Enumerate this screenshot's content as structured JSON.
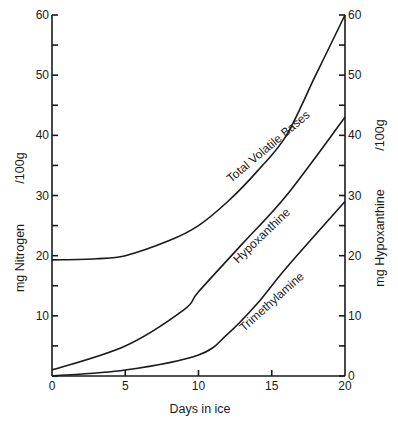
{
  "chart_data": {
    "type": "line",
    "title": "",
    "xlabel": "Days in ice",
    "ylabel": "mg Nitrogen /100g",
    "ylabel_right": "mg Hypoxanthine /100g",
    "xlim": [
      0,
      20
    ],
    "ylim": [
      0,
      60
    ],
    "ylim_right": [
      0,
      60
    ],
    "x_ticks": [
      0,
      5,
      10,
      15,
      20
    ],
    "y_ticks": [
      0,
      10,
      20,
      30,
      40,
      50,
      60
    ],
    "y_ticks_right": [
      0,
      10,
      20,
      30,
      40,
      50,
      60
    ],
    "grid": false,
    "legend": "inline labels along curves",
    "series": [
      {
        "name": "Total Volatile Bases",
        "axis": "left",
        "x": [
          0,
          3,
          5,
          8,
          10,
          12,
          14,
          16,
          18,
          20
        ],
        "values": [
          19.3,
          19.5,
          20,
          22.5,
          25,
          29,
          34,
          40,
          50,
          60
        ]
      },
      {
        "name": "Hypoxanthine",
        "axis": "right",
        "x": [
          0,
          5,
          9,
          10,
          13,
          16,
          20
        ],
        "values": [
          1,
          5,
          11,
          14,
          22,
          30,
          43
        ]
      },
      {
        "name": "Trimethylamine",
        "axis": "left",
        "x": [
          0,
          5,
          10,
          12,
          14,
          16,
          20
        ],
        "values": [
          0,
          1,
          3.5,
          7,
          12,
          18,
          29
        ]
      }
    ]
  },
  "labels": {
    "xlabel": "Days in ice",
    "ylabel_left_main": "mg Nitrogen",
    "ylabel_left_unit": "/100g",
    "ylabel_right_main": "mg Hypoxanthine",
    "ylabel_right_unit": "/100g",
    "curve_tvb": "Total Volatile Bases",
    "curve_hx": "Hypoxanthine",
    "curve_tma": "Trimethylamine"
  }
}
